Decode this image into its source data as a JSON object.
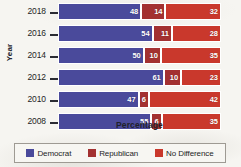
{
  "chart_data": {
    "type": "bar",
    "subtype": "stacked-horizontal-100pct",
    "title": "",
    "xlabel": "Percentage",
    "ylabel": "Year",
    "categories": [
      "2018",
      "2016",
      "2014",
      "2012",
      "2010",
      "2008"
    ],
    "xlim": [
      0,
      100
    ],
    "grid": false,
    "legend_position": "bottom",
    "series": [
      {
        "name": "Democrat",
        "color": "#4a4a9b",
        "values": [
          48,
          54,
          50,
          61,
          47,
          55
        ]
      },
      {
        "name": "Republican",
        "color": "#a33131",
        "values": [
          14,
          11,
          10,
          10,
          6,
          6
        ]
      },
      {
        "name": "No Difference",
        "color": "#c9382c",
        "values": [
          32,
          28,
          35,
          23,
          42,
          35
        ]
      }
    ],
    "bars": [
      {
        "category": "2018",
        "segments": [
          {
            "series": "Democrat",
            "value": 48,
            "label": "48"
          },
          {
            "series": "Republican",
            "value": 14,
            "label": "14"
          },
          {
            "series": "No Difference",
            "value": 32,
            "label": "32"
          }
        ]
      },
      {
        "category": "2016",
        "segments": [
          {
            "series": "Democrat",
            "value": 54,
            "label": "54"
          },
          {
            "series": "Republican",
            "value": 11,
            "label": "11"
          },
          {
            "series": "No Difference",
            "value": 28,
            "label": "28"
          }
        ]
      },
      {
        "category": "2014",
        "segments": [
          {
            "series": "Democrat",
            "value": 50,
            "label": "50"
          },
          {
            "series": "Republican",
            "value": 10,
            "label": "10"
          },
          {
            "series": "No Difference",
            "value": 35,
            "label": "35"
          }
        ]
      },
      {
        "category": "2012",
        "segments": [
          {
            "series": "Democrat",
            "value": 61,
            "label": "61"
          },
          {
            "series": "Republican",
            "value": 10,
            "label": "10"
          },
          {
            "series": "No Difference",
            "value": 23,
            "label": "23"
          }
        ]
      },
      {
        "category": "2010",
        "segments": [
          {
            "series": "Democrat",
            "value": 47,
            "label": "47"
          },
          {
            "series": "Republican",
            "value": 6,
            "label": "6"
          },
          {
            "series": "No Difference",
            "value": 42,
            "label": "42"
          }
        ]
      },
      {
        "category": "2008",
        "segments": [
          {
            "series": "Democrat",
            "value": 55,
            "label": "55"
          },
          {
            "series": "Republican",
            "value": 6,
            "label": "6"
          },
          {
            "series": "No Difference",
            "value": 35,
            "label": "35"
          }
        ]
      }
    ]
  },
  "axes": {
    "x_title": "Percentage",
    "y_title": "Year",
    "y_ticks": [
      "2018",
      "2016",
      "2014",
      "2012",
      "2010",
      "2008"
    ]
  },
  "legend": {
    "items": [
      {
        "label": "Democrat",
        "color": "#4a4a9b"
      },
      {
        "label": "Republican",
        "color": "#a33131"
      },
      {
        "label": "No Difference",
        "color": "#c9382c"
      }
    ]
  }
}
